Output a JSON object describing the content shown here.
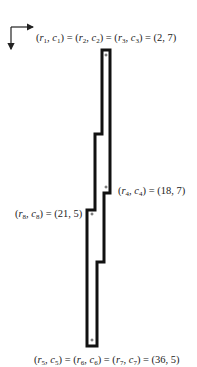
{
  "diagram": {
    "axes": {
      "icon_right": "arrow-right-icon",
      "icon_down": "arrow-down-icon"
    },
    "labels": {
      "top": {
        "text": "(r1, c1) = (r2, c2) = (r3, c3) = (2, 7)",
        "value": "(2, 7)"
      },
      "r4": {
        "text": "(r4, c4) = (18, 7)",
        "value": "(18, 7)"
      },
      "r8": {
        "text": "(r8, c8) = (21, 5)",
        "value": "(21, 5)"
      },
      "bottom": {
        "text": "(r5, c5) = (r6, c6) = (r7, c7) = (36, 5)",
        "value": "(36, 5)"
      }
    },
    "markers": [
      {
        "name": "plus-marker-top",
        "x": 106,
        "y": 55
      },
      {
        "name": "plus-marker-r4",
        "x": 106,
        "y": 187
      },
      {
        "name": "plus-marker-r8",
        "x": 92,
        "y": 214
      },
      {
        "name": "plus-marker-bottom",
        "x": 92,
        "y": 340
      }
    ],
    "stroke_color": "#111111"
  }
}
